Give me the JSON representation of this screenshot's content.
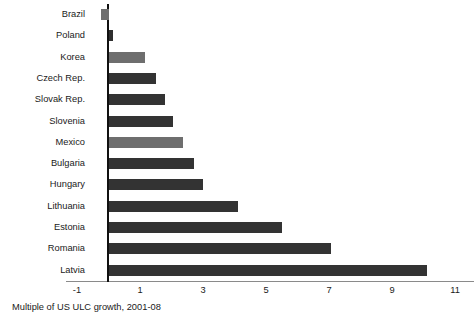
{
  "chart_data": {
    "type": "bar",
    "orientation": "horizontal",
    "title": "",
    "xlabel": "Multiple of US ULC growth, 2001-08",
    "ylabel": "",
    "categories": [
      "Brazil",
      "Poland",
      "Korea",
      "Czech Rep.",
      "Slovak Rep.",
      "Slovenia",
      "Mexico",
      "Bulgaria",
      "Hungary",
      "Lithuania",
      "Estonia",
      "Romania",
      "Latvia"
    ],
    "values": [
      -0.25,
      0.15,
      1.15,
      1.5,
      1.8,
      2.05,
      2.35,
      2.7,
      3.0,
      4.1,
      5.5,
      7.05,
      10.1
    ],
    "bar_colors": [
      "#6e6e6e",
      "#2f2f2f",
      "#6e6e6e",
      "#333333",
      "#333333",
      "#333333",
      "#6e6e6e",
      "#333333",
      "#333333",
      "#333333",
      "#333333",
      "#333333",
      "#333333"
    ],
    "xticks": [
      -1,
      1,
      3,
      5,
      7,
      9,
      11
    ],
    "xtick_labels": [
      "-1",
      "1",
      "3",
      "5",
      "7",
      "9",
      "11"
    ],
    "xlim": [
      -1.35,
      11.6
    ],
    "grid": false,
    "legend": null,
    "axis_color": "#8a8a8a",
    "zero_line_color": "#111111"
  },
  "caption": {
    "text": "Multiple of US ULC growth, 2001-08"
  }
}
